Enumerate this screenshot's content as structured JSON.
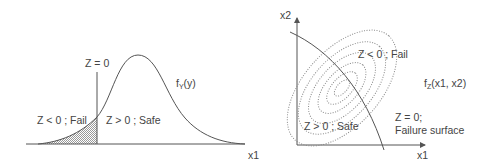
{
  "left_diagram": {
    "limit_label": "Z = 0",
    "density_label": "f",
    "density_sub": "Y",
    "density_arg": "(y)",
    "fail_label": "Z < 0 ; Fail",
    "safe_label": "Z > 0 ; Safe",
    "axis_label": "x1"
  },
  "right_diagram": {
    "y_axis_label": "x2",
    "x_axis_label": "x1",
    "fail_label": "Z < 0 ; Fail",
    "safe_label": "Z > 0 ; Safe",
    "density_label": "f",
    "density_sub": "Z",
    "density_arg": "(x1, x2)",
    "surface_label_1": "Z = 0;",
    "surface_label_2": "Failure surface"
  },
  "colors": {
    "line": "#555555",
    "dotted": "#888888",
    "text": "#444444"
  }
}
